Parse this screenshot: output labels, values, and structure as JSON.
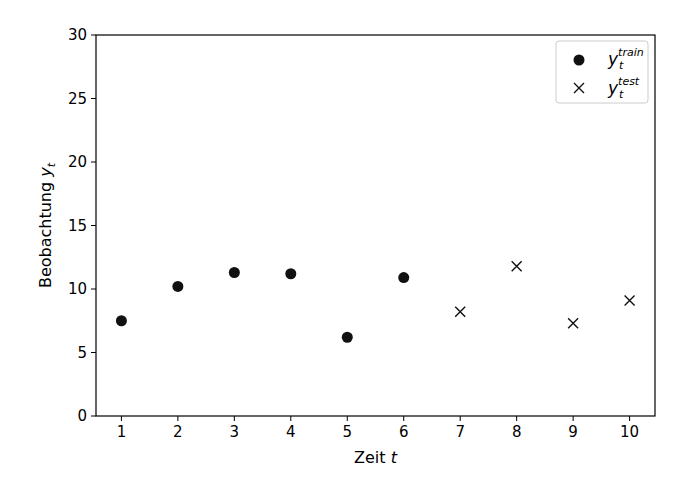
{
  "chart_data": {
    "type": "scatter",
    "title": "",
    "xlabel": "Zeit t",
    "ylabel": "Beobachtung y_t",
    "xlim": [
      0.55,
      10.45
    ],
    "ylim": [
      0,
      30
    ],
    "x_ticks": [
      1,
      2,
      3,
      4,
      5,
      6,
      7,
      8,
      9,
      10
    ],
    "y_ticks": [
      0,
      5,
      10,
      15,
      20,
      25,
      30
    ],
    "grid": false,
    "legend_position": "upper right",
    "series": [
      {
        "name": "y_t^train",
        "marker": "circle",
        "x": [
          1,
          2,
          3,
          4,
          5,
          6
        ],
        "values": [
          7.5,
          10.2,
          11.3,
          11.2,
          6.2,
          10.9
        ]
      },
      {
        "name": "y_t^test",
        "marker": "x",
        "x": [
          7,
          8,
          9,
          10
        ],
        "values": [
          8.2,
          11.8,
          7.3,
          9.1
        ]
      }
    ]
  },
  "labels": {
    "xlabel_main": "Zeit ",
    "xlabel_var": "t",
    "ylabel_main": "Beobachtung ",
    "ylabel_var": "y",
    "ylabel_sub": "t",
    "legend_train_sup": "train",
    "legend_test_sup": "test",
    "legend_var": "y",
    "legend_sub": "t"
  }
}
